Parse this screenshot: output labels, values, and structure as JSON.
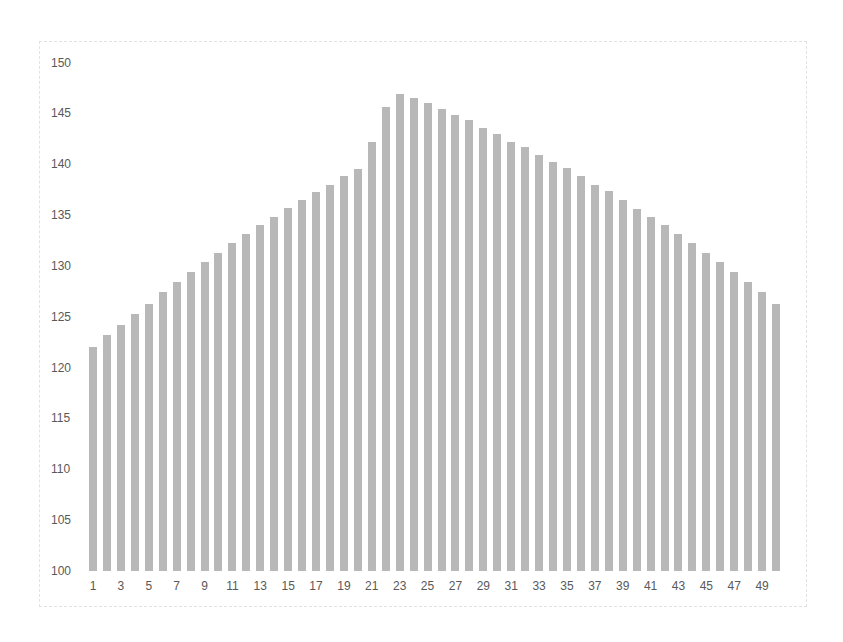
{
  "chart_data": {
    "type": "bar",
    "title": "",
    "xlabel": "",
    "ylabel": "",
    "ylim": [
      100,
      150
    ],
    "yticks": [
      100,
      105,
      110,
      115,
      120,
      125,
      130,
      135,
      140,
      145,
      150
    ],
    "xtick_labels": [
      "1",
      "3",
      "5",
      "7",
      "9",
      "11",
      "13",
      "15",
      "17",
      "19",
      "21",
      "23",
      "25",
      "27",
      "29",
      "31",
      "33",
      "35",
      "37",
      "39",
      "41",
      "43",
      "45",
      "47",
      "49"
    ],
    "grid": false,
    "legend": null,
    "bar_color": "#b8b8b8",
    "categories": [
      1,
      2,
      3,
      4,
      5,
      6,
      7,
      8,
      9,
      10,
      11,
      12,
      13,
      14,
      15,
      16,
      17,
      18,
      19,
      20,
      21,
      22,
      23,
      24,
      25,
      26,
      27,
      28,
      29,
      30,
      31,
      32,
      33,
      34,
      35,
      36,
      37,
      38,
      39,
      40,
      41,
      42,
      43,
      44,
      45,
      46,
      47,
      48,
      49,
      50
    ],
    "values": [
      122.0,
      123.2,
      124.2,
      125.3,
      126.3,
      127.4,
      128.4,
      129.4,
      130.4,
      131.3,
      132.3,
      133.1,
      134.0,
      134.8,
      135.7,
      136.5,
      137.3,
      138.0,
      138.8,
      139.5,
      142.2,
      145.6,
      146.9,
      146.5,
      146.0,
      145.4,
      144.8,
      144.3,
      143.6,
      143.0,
      142.2,
      141.7,
      140.9,
      140.2,
      139.6,
      138.8,
      138.0,
      137.4,
      136.5,
      135.6,
      134.8,
      134.0,
      133.1,
      132.3,
      131.3,
      130.4,
      129.4,
      128.4,
      127.4,
      126.3
    ]
  }
}
